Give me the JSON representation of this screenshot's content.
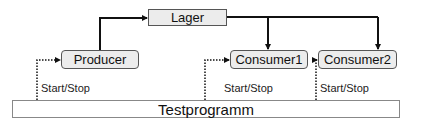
{
  "diagram": {
    "nodes": {
      "lager": {
        "label": "Lager"
      },
      "producer": {
        "label": "Producer"
      },
      "consumer1": {
        "label": "Consumer1"
      },
      "consumer2": {
        "label": "Consumer2"
      },
      "testprogramm": {
        "label": "Testprogramm"
      }
    },
    "edges": [
      {
        "from": "producer",
        "to": "lager",
        "style": "solid-thick",
        "arrow": "to"
      },
      {
        "from": "lager",
        "to": "consumer1",
        "style": "solid-thick",
        "arrow": "to"
      },
      {
        "from": "lager",
        "to": "consumer2",
        "style": "solid-thick",
        "arrow": "to"
      },
      {
        "from": "testprogramm",
        "to": "producer",
        "style": "dotted",
        "label": "Start/Stop",
        "arrow": "to"
      },
      {
        "from": "testprogramm",
        "to": "consumer1",
        "style": "dotted",
        "label": "Start/Stop",
        "arrow": "to"
      },
      {
        "from": "testprogramm",
        "to": "consumer2",
        "style": "dotted",
        "label": "Start/Stop",
        "arrow": "to"
      }
    ],
    "edge_labels": {
      "producer": "Start/Stop",
      "consumer1": "Start/Stop",
      "consumer2": "Start/Stop"
    },
    "colors": {
      "box_fill": "#ececec",
      "box_border": "#555555",
      "line": "#111111"
    }
  }
}
